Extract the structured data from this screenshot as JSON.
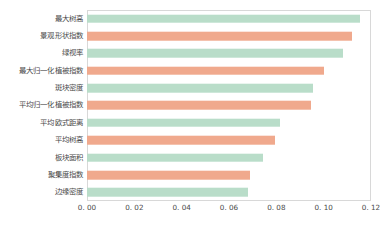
{
  "chart_data": {
    "type": "bar",
    "orientation": "horizontal",
    "title": "",
    "xlabel": "",
    "ylabel": "",
    "xlim": [
      0.0,
      0.12
    ],
    "xticks": [
      "0. 00",
      "0. 02",
      "0. 04",
      "0. 06",
      "0. 08",
      "0. 10",
      "0. 12"
    ],
    "xtick_values": [
      0.0,
      0.02,
      0.04,
      0.06,
      0.08,
      0.1,
      0.12
    ],
    "grid": false,
    "legend": "none",
    "colors": {
      "green": "#b9ddc9",
      "salmon": "#f0a98d",
      "frame": "#d8d8d8",
      "text": "#4a4a4a",
      "background": "#ffffff"
    },
    "categories": [
      "最大树高",
      "景观形状指数",
      "绿视率",
      "最大归一化植被指数",
      "斑块密度",
      "平均归一化植被指数",
      "平均欧式距离",
      "平均树高",
      "板块面积",
      "聚集度指数",
      "边缘密度"
    ],
    "values": [
      0.1155,
      0.112,
      0.108,
      0.1,
      0.0955,
      0.0945,
      0.0815,
      0.0795,
      0.0745,
      0.069,
      0.068
    ],
    "bar_colors": [
      "green",
      "salmon",
      "green",
      "salmon",
      "green",
      "salmon",
      "green",
      "salmon",
      "green",
      "salmon",
      "green"
    ]
  }
}
